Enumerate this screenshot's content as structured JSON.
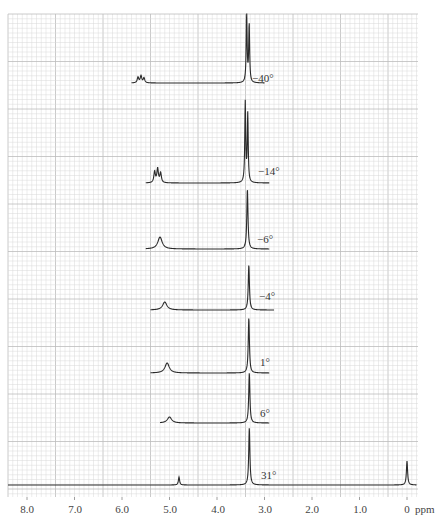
{
  "chart_data": {
    "type": "line",
    "title": "",
    "xlabel": "ppm",
    "ylabel": "",
    "x_axis": {
      "direction": "reversed",
      "range": [
        8.4,
        -0.2
      ],
      "ticks": [
        8.0,
        7.0,
        6.0,
        5.0,
        4.0,
        3.0,
        2.0,
        1.0,
        0
      ],
      "tick_labels": [
        "8.0",
        "7.0",
        "6.0",
        "5.0",
        "4.0",
        "3.0",
        "2.0",
        "1.0",
        "0"
      ],
      "unit": "ppm"
    },
    "grid": true,
    "stacked": true,
    "series": [
      {
        "name": "-40°",
        "label": "−40°",
        "baseline_y": 83,
        "start_ppm": 5.8,
        "end_ppm": 3.0,
        "peaks": [
          {
            "ppm": 5.6,
            "height": 7,
            "shape": "multiplet"
          },
          {
            "ppm": 3.35,
            "height": 68,
            "shape": "doublet"
          }
        ]
      },
      {
        "name": "-14°",
        "label": "−14°",
        "baseline_y": 183,
        "start_ppm": 5.5,
        "end_ppm": 2.9,
        "peaks": [
          {
            "ppm": 5.25,
            "height": 14,
            "shape": "multiplet"
          },
          {
            "ppm": 3.38,
            "height": 80,
            "shape": "doublet"
          }
        ]
      },
      {
        "name": "-6°",
        "label": "−6°",
        "baseline_y": 249,
        "start_ppm": 5.5,
        "end_ppm": 2.9,
        "peaks": [
          {
            "ppm": 5.2,
            "height": 12,
            "shape": "broad"
          },
          {
            "ppm": 3.36,
            "height": 60,
            "shape": "singlet"
          }
        ]
      },
      {
        "name": "-4°",
        "label": "−4°",
        "baseline_y": 310,
        "start_ppm": 5.4,
        "end_ppm": 2.8,
        "peaks": [
          {
            "ppm": 5.1,
            "height": 8,
            "shape": "broad"
          },
          {
            "ppm": 3.33,
            "height": 45,
            "shape": "singlet"
          }
        ]
      },
      {
        "name": "1°",
        "label": "1°",
        "baseline_y": 373,
        "start_ppm": 5.4,
        "end_ppm": 2.9,
        "peaks": [
          {
            "ppm": 5.05,
            "height": 10,
            "shape": "broad"
          },
          {
            "ppm": 3.33,
            "height": 55,
            "shape": "singlet"
          }
        ]
      },
      {
        "name": "6°",
        "label": "6°",
        "baseline_y": 423,
        "start_ppm": 5.2,
        "end_ppm": 2.9,
        "peaks": [
          {
            "ppm": 5.0,
            "height": 6,
            "shape": "broad"
          },
          {
            "ppm": 3.32,
            "height": 50,
            "shape": "singlet"
          }
        ]
      },
      {
        "name": "31°",
        "label": "31°",
        "baseline_y": 485,
        "start_ppm": 8.4,
        "end_ppm": -0.2,
        "peaks": [
          {
            "ppm": 4.8,
            "height": 8,
            "shape": "singlet"
          },
          {
            "ppm": 3.32,
            "height": 57,
            "shape": "singlet"
          },
          {
            "ppm": 0.0,
            "height": 24,
            "shape": "singlet"
          }
        ]
      }
    ],
    "annotations": [
      "−40°",
      "−14°",
      "−6°",
      "−4°",
      "1°",
      "6°",
      "31°"
    ]
  },
  "axis": {
    "unit": "ppm",
    "tick_labels": [
      "8.0",
      "7.0",
      "6.0",
      "5.0",
      "4.0",
      "3.0",
      "2.0",
      "1.0",
      "0"
    ]
  },
  "colors": {
    "grid_minor": "#d8d8d8",
    "grid_major": "#bdbdbd",
    "trace": "#2a2a2a",
    "text": "#444444"
  }
}
